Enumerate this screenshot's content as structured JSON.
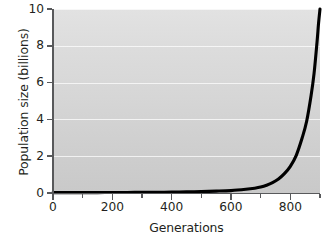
{
  "chart_data": {
    "type": "line",
    "title": "",
    "xlabel": "Generations",
    "ylabel": "Population size (billions)",
    "xlim": [
      0,
      900
    ],
    "ylim": [
      0,
      10
    ],
    "grid": "horizontal",
    "legend": "none",
    "line_color": "#000000",
    "panel_background": "#d6d6d6",
    "gridline_color": "#ffffff",
    "axis_color": "#58595b",
    "x_ticks": [
      {
        "value": 0,
        "label": "0",
        "kind": "major"
      },
      {
        "value": 100,
        "label": "",
        "kind": "minor"
      },
      {
        "value": 200,
        "label": "200",
        "kind": "major"
      },
      {
        "value": 300,
        "label": "",
        "kind": "minor"
      },
      {
        "value": 400,
        "label": "400",
        "kind": "major"
      },
      {
        "value": 500,
        "label": "",
        "kind": "minor"
      },
      {
        "value": 600,
        "label": "600",
        "kind": "major"
      },
      {
        "value": 700,
        "label": "",
        "kind": "minor"
      },
      {
        "value": 800,
        "label": "800",
        "kind": "major"
      },
      {
        "value": 900,
        "label": "",
        "kind": "minor"
      }
    ],
    "y_ticks": [
      {
        "value": 0,
        "label": "0"
      },
      {
        "value": 2,
        "label": "2"
      },
      {
        "value": 4,
        "label": "4"
      },
      {
        "value": 6,
        "label": "6"
      },
      {
        "value": 8,
        "label": "8"
      },
      {
        "value": 10,
        "label": "10"
      }
    ],
    "series": [
      {
        "name": "Exponential population growth",
        "x": [
          0,
          50,
          100,
          150,
          200,
          250,
          300,
          350,
          400,
          450,
          500,
          550,
          600,
          650,
          680,
          700,
          720,
          740,
          760,
          780,
          800,
          820,
          840,
          855,
          870,
          880,
          890,
          895,
          900
        ],
        "y": [
          0.02,
          0.02,
          0.02,
          0.02,
          0.03,
          0.03,
          0.04,
          0.04,
          0.05,
          0.06,
          0.08,
          0.1,
          0.13,
          0.2,
          0.26,
          0.32,
          0.42,
          0.56,
          0.76,
          1.05,
          1.45,
          2.05,
          3.0,
          3.9,
          5.3,
          6.5,
          8.2,
          9.2,
          10.0
        ]
      }
    ]
  }
}
